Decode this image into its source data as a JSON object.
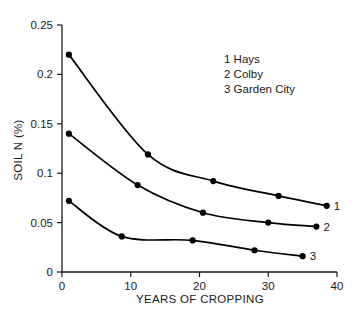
{
  "chart_data": {
    "type": "line",
    "title": "",
    "xlabel": "YEARS OF CROPPING",
    "ylabel": "SOIL N (%)",
    "xlim": [
      0,
      40
    ],
    "ylim": [
      0,
      0.25
    ],
    "xticks": [
      "0",
      "10",
      "20",
      "30",
      "40"
    ],
    "xtick_values": [
      0,
      10,
      20,
      30,
      40
    ],
    "yticks": [
      "0",
      "0.05",
      "0.1",
      "0.15",
      "0.2",
      "0.25"
    ],
    "ytick_values": [
      0,
      0.05,
      0.1,
      0.15,
      0.2,
      0.25
    ],
    "grid": false,
    "legend_position": "upper-right-inside",
    "marker": "filled-circle",
    "series": [
      {
        "key": "1",
        "name": "Hays",
        "legend_entry": "1 Hays",
        "end_label": "1",
        "x": [
          1,
          12.5,
          22,
          31.5,
          38.5
        ],
        "y": [
          0.22,
          0.119,
          0.092,
          0.077,
          0.067
        ]
      },
      {
        "key": "2",
        "name": "Colby",
        "legend_entry": "2 Colby",
        "end_label": "2",
        "x": [
          1,
          11,
          20.5,
          30,
          37
        ],
        "y": [
          0.14,
          0.088,
          0.06,
          0.05,
          0.046
        ]
      },
      {
        "key": "3",
        "name": "Garden City",
        "legend_entry": "3 Garden City",
        "end_label": "3",
        "x": [
          1,
          8.7,
          19,
          28,
          35
        ],
        "y": [
          0.072,
          0.036,
          0.032,
          0.022,
          0.016
        ]
      }
    ],
    "colors": {
      "line": "#000000",
      "marker": "#000000",
      "axis": "#1a1a1a",
      "background": "#ffffff"
    }
  }
}
